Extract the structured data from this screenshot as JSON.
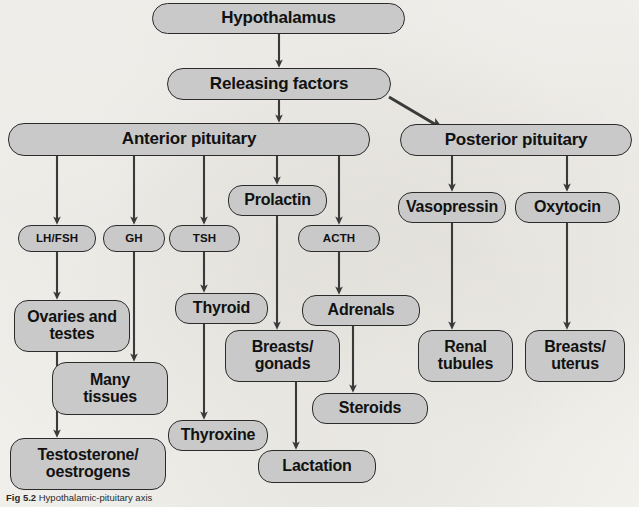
{
  "figure": {
    "type": "flowchart",
    "background_color": "#f6f5f2",
    "node_fill_color": "#c9c9c9",
    "node_border_color": "#2b2b2b",
    "arrow_color": "#333333",
    "caption_label": "Fig 5.2",
    "caption_text": "Hypothalamic-pituitary axis"
  },
  "nodes": [
    {
      "id": "hypothalamus",
      "label": "Hypothalamus",
      "size": "big",
      "x": 152,
      "y": 3,
      "w": 253,
      "h": 31
    },
    {
      "id": "releasing",
      "label": "Releasing factors",
      "size": "big",
      "x": 167,
      "y": 68,
      "w": 224,
      "h": 32
    },
    {
      "id": "anterior",
      "label": "Anterior pituitary",
      "size": "big",
      "x": 8,
      "y": 123,
      "w": 362,
      "h": 33
    },
    {
      "id": "posterior",
      "label": "Posterior pituitary",
      "size": "big",
      "x": 400,
      "y": 124,
      "w": 232,
      "h": 32
    },
    {
      "id": "prolactin",
      "label": "Prolactin",
      "size": "med",
      "x": 228,
      "y": 185,
      "w": 99,
      "h": 31
    },
    {
      "id": "vasopressin",
      "label": "Vasopressin",
      "size": "med",
      "x": 398,
      "y": 192,
      "w": 108,
      "h": 31
    },
    {
      "id": "oxytocin",
      "label": "Oxytocin",
      "size": "med",
      "x": 515,
      "y": 192,
      "w": 105,
      "h": 31
    },
    {
      "id": "lhfsh",
      "label": "LH/FSH",
      "size": "small",
      "x": 18,
      "y": 225,
      "w": 78,
      "h": 27
    },
    {
      "id": "gh",
      "label": "GH",
      "size": "small",
      "x": 103,
      "y": 225,
      "w": 62,
      "h": 27
    },
    {
      "id": "tsh",
      "label": "TSH",
      "size": "small",
      "x": 169,
      "y": 225,
      "w": 71,
      "h": 27
    },
    {
      "id": "acth",
      "label": "ACTH",
      "size": "small",
      "x": 298,
      "y": 225,
      "w": 82,
      "h": 27
    },
    {
      "id": "ovaries",
      "label": "Ovaries and\ntestes",
      "size": "med",
      "x": 14,
      "y": 300,
      "w": 116,
      "h": 52
    },
    {
      "id": "thyroid",
      "label": "Thyroid",
      "size": "med",
      "x": 175,
      "y": 293,
      "w": 93,
      "h": 31
    },
    {
      "id": "adrenals",
      "label": "Adrenals",
      "size": "med",
      "x": 302,
      "y": 295,
      "w": 118,
      "h": 31
    },
    {
      "id": "renal",
      "label": "Renal\ntubules",
      "size": "med",
      "x": 418,
      "y": 330,
      "w": 95,
      "h": 52
    },
    {
      "id": "breastsuterus",
      "label": "Breasts/\nuterus",
      "size": "med",
      "x": 525,
      "y": 330,
      "w": 100,
      "h": 52
    },
    {
      "id": "breastsgonads",
      "label": "Breasts/\ngonads",
      "size": "med",
      "x": 225,
      "y": 330,
      "w": 115,
      "h": 52
    },
    {
      "id": "manytissues",
      "label": "Many\ntissues",
      "size": "med",
      "x": 52,
      "y": 362,
      "w": 116,
      "h": 53
    },
    {
      "id": "steroids",
      "label": "Steroids",
      "size": "med",
      "x": 312,
      "y": 393,
      "w": 116,
      "h": 31
    },
    {
      "id": "thyroxine",
      "label": "Thyroxine",
      "size": "med",
      "x": 168,
      "y": 420,
      "w": 100,
      "h": 31
    },
    {
      "id": "testosterone",
      "label": "Testosterone/\noestrogens",
      "size": "med",
      "x": 10,
      "y": 438,
      "w": 156,
      "h": 52
    },
    {
      "id": "lactation",
      "label": "Lactation",
      "size": "med",
      "x": 258,
      "y": 450,
      "w": 118,
      "h": 33
    }
  ],
  "edges": [
    {
      "from": "hypothalamus",
      "to": "releasing",
      "kind": "vertical"
    },
    {
      "from": "releasing",
      "to": "anterior",
      "kind": "vertical"
    },
    {
      "from": "releasing",
      "to": "posterior",
      "kind": "diagonal"
    },
    {
      "from": "anterior",
      "to": "lhfsh",
      "kind": "elbow"
    },
    {
      "from": "anterior",
      "to": "gh",
      "kind": "elbow"
    },
    {
      "from": "anterior",
      "to": "tsh",
      "kind": "elbow"
    },
    {
      "from": "anterior",
      "to": "prolactin",
      "kind": "vertical"
    },
    {
      "from": "anterior",
      "to": "acth",
      "kind": "elbow"
    },
    {
      "from": "posterior",
      "to": "vasopressin",
      "kind": "vertical"
    },
    {
      "from": "posterior",
      "to": "oxytocin",
      "kind": "vertical"
    },
    {
      "from": "lhfsh",
      "to": "ovaries",
      "kind": "vertical"
    },
    {
      "from": "gh",
      "to": "manytissues",
      "kind": "vertical"
    },
    {
      "from": "tsh",
      "to": "thyroid",
      "kind": "vertical"
    },
    {
      "from": "prolactin",
      "to": "breastsgonads",
      "kind": "vertical"
    },
    {
      "from": "acth",
      "to": "adrenals",
      "kind": "vertical"
    },
    {
      "from": "ovaries",
      "to": "testosterone",
      "kind": "vertical"
    },
    {
      "from": "thyroid",
      "to": "thyroxine",
      "kind": "vertical"
    },
    {
      "from": "adrenals",
      "to": "steroids",
      "kind": "vertical"
    },
    {
      "from": "breastsgonads",
      "to": "lactation",
      "kind": "vertical"
    },
    {
      "from": "vasopressin",
      "to": "renal",
      "kind": "vertical"
    },
    {
      "from": "oxytocin",
      "to": "breastsuterus",
      "kind": "vertical"
    }
  ]
}
